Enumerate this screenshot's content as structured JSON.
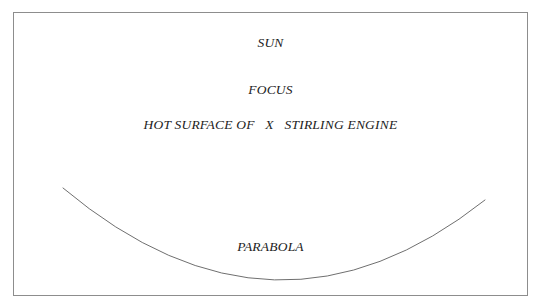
{
  "diagram": {
    "background_color": "#ffffff",
    "frame": {
      "name": "diagram-border",
      "stroke_color": "#8d8d8d",
      "stroke_width": 1,
      "x": 13,
      "y": 12,
      "width": 515,
      "height": 284
    },
    "labels": [
      {
        "id": "sun",
        "text": "SUN"
      },
      {
        "id": "focus",
        "text": "FOCUS"
      },
      {
        "id": "hot",
        "text": "HOT SURFACE OF   X   STIRLING ENGINE"
      },
      {
        "id": "parabola",
        "text": "PARABOLA"
      }
    ],
    "curve": {
      "name": "parabola-curve",
      "stroke_color": "#6f6f6f",
      "stroke_width": 1,
      "path": "M 63 188 Q 275 366 485 200",
      "left_endpoint": [
        63,
        188
      ],
      "vertex": [
        275,
        277
      ],
      "right_endpoint": [
        485,
        200
      ]
    }
  }
}
